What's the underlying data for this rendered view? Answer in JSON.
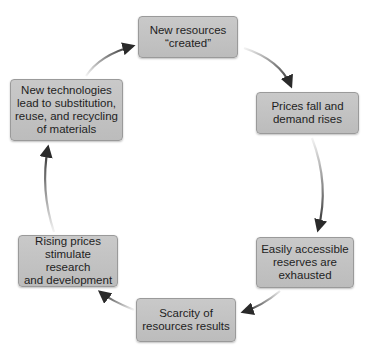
{
  "diagram": {
    "type": "cycle",
    "nodes": [
      {
        "id": "new-resources",
        "label": "New resources\n“created”"
      },
      {
        "id": "prices-fall",
        "label": "Prices fall and\ndemand rises"
      },
      {
        "id": "reserves-exhausted",
        "label": "Easily accessible\nreserves are\nexhausted"
      },
      {
        "id": "scarcity",
        "label": "Scarcity of\nresources results"
      },
      {
        "id": "rising-prices",
        "label": "Rising prices\nstimulate research\nand development"
      },
      {
        "id": "new-technologies",
        "label": "New technologies\nlead to substitution,\nreuse, and recycling\nof materials"
      }
    ],
    "edges": [
      {
        "from": "new-resources",
        "to": "prices-fall"
      },
      {
        "from": "prices-fall",
        "to": "reserves-exhausted"
      },
      {
        "from": "reserves-exhausted",
        "to": "scarcity"
      },
      {
        "from": "scarcity",
        "to": "rising-prices"
      },
      {
        "from": "rising-prices",
        "to": "new-technologies"
      },
      {
        "from": "new-technologies",
        "to": "new-resources"
      }
    ],
    "colors": {
      "box_fill": "#c4c4c4",
      "box_border": "#9a9a9a",
      "arrow": "#2a2a2a",
      "text": "#1e1e1e"
    }
  }
}
